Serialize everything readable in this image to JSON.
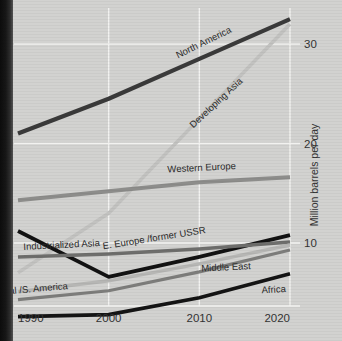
{
  "chart_data": {
    "type": "line",
    "title": "",
    "xlabel": "",
    "ylabel": "Million barrels per day",
    "x": [
      1990,
      2000,
      2010,
      2020
    ],
    "xticklabels": [
      "1990",
      "2000",
      "2010",
      "2020"
    ],
    "yticks": [
      10,
      20,
      30
    ],
    "yticklabels": [
      "10",
      "20",
      "30"
    ],
    "ylim": [
      0,
      33
    ],
    "xlim": [
      1990,
      2020
    ],
    "grid": true,
    "legend_position": "inline-labels",
    "series": [
      {
        "name": "North America",
        "values": [
          21.0,
          24.5,
          28.5,
          32.5
        ],
        "color": "#3a3a3a",
        "width": 4.2
      },
      {
        "name": "Developing Asia",
        "values": [
          7.0,
          13.0,
          22.5,
          32.0
        ],
        "color": "#c2c2c0",
        "width": 3.6
      },
      {
        "name": "Western Europe",
        "values": [
          14.3,
          15.2,
          16.1,
          16.6
        ],
        "color": "#8d8d8b",
        "width": 4.0
      },
      {
        "name": "E. Europe /former USSR",
        "values": [
          11.2,
          6.6,
          8.6,
          10.8
        ],
        "color": "#121212",
        "width": 3.8
      },
      {
        "name": "Industrialized Asia",
        "values": [
          8.6,
          8.9,
          9.4,
          10.1
        ],
        "color": "#6e6e6c",
        "width": 3.4
      },
      {
        "name": "Central /S. America",
        "values": [
          5.1,
          6.2,
          7.9,
          9.8
        ],
        "color": "#b6b6b4",
        "width": 3.4
      },
      {
        "name": "Middle East",
        "values": [
          4.3,
          5.2,
          7.1,
          9.3
        ],
        "color": "#7d7d7b",
        "width": 3.2
      },
      {
        "name": "Africa",
        "values": [
          2.6,
          2.8,
          4.5,
          6.9
        ],
        "color": "#141414",
        "width": 3.6
      }
    ],
    "annotations": [
      {
        "text": "North America",
        "x": 232,
        "y": 32,
        "rotate": -26
      },
      {
        "text": "Developing Asia",
        "x": 243,
        "y": 82,
        "rotate": -43
      },
      {
        "text": "Western Europe",
        "x": 236,
        "y": 169,
        "rotate": -3
      },
      {
        "text": "E. Europe /former USSR",
        "x": 206,
        "y": 233,
        "rotate": -9
      },
      {
        "text": "Industrialized Asia",
        "x": 100,
        "y": 246,
        "rotate": -3
      },
      {
        "text": "Central /S. America",
        "x": 68,
        "y": 289,
        "rotate": -5
      },
      {
        "text": "Middle East",
        "x": 251,
        "y": 269,
        "rotate": -3
      },
      {
        "text": "Africa",
        "x": 286,
        "y": 292,
        "rotate": -3
      }
    ]
  }
}
